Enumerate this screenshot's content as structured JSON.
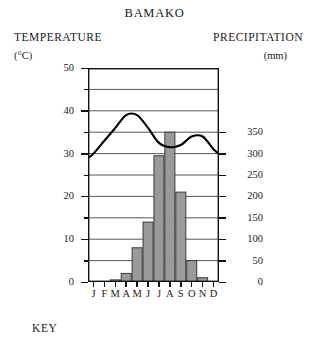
{
  "chart": {
    "title": "BAMAKO",
    "left_axis_title": "TEMPERATURE",
    "left_axis_unit": "(°C)",
    "right_axis_title": "PRECIPITATION",
    "right_axis_unit": "(mm)",
    "key_label": "KEY"
  },
  "chart_data": {
    "type": "bar",
    "title": "BAMAKO",
    "subtitle": "",
    "xlabel": "",
    "ylabel": "TEMPERATURE (°C)",
    "y2label": "PRECIPITATION (mm)",
    "grid": true,
    "legend": "none",
    "categories": [
      "J",
      "F",
      "M",
      "A",
      "M",
      "J",
      "J",
      "A",
      "S",
      "O",
      "N",
      "D"
    ],
    "month_names": [
      "January",
      "February",
      "March",
      "April",
      "May",
      "June",
      "July",
      "August",
      "September",
      "October",
      "November",
      "December"
    ],
    "ylim": [
      0,
      50
    ],
    "y2lim": [
      0,
      500
    ],
    "yticks": [
      0,
      10,
      20,
      30,
      40,
      50
    ],
    "yticks_minor": [
      5,
      15,
      25,
      35,
      45
    ],
    "y2ticks": [
      0,
      50,
      100,
      150,
      200,
      250,
      300,
      350
    ],
    "series": [
      {
        "name": "Precipitation",
        "type": "bar",
        "axis": "right",
        "unit": "mm",
        "color": "#9a9a9a",
        "edge_color": "#3a3a3a",
        "values": [
          0,
          0,
          5,
          20,
          80,
          140,
          295,
          350,
          210,
          50,
          10,
          0
        ]
      },
      {
        "name": "Temperature",
        "type": "line",
        "axis": "left",
        "unit": "°C",
        "color": "#000000",
        "values": [
          30,
          33,
          36,
          39,
          39,
          36,
          32.5,
          31.5,
          32,
          34,
          34,
          31
        ]
      }
    ]
  }
}
